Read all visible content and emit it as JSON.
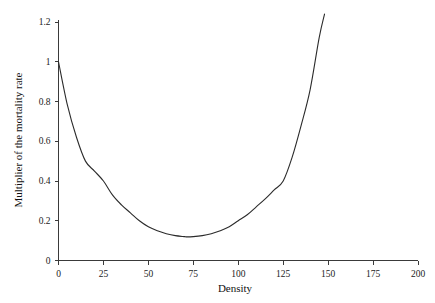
{
  "figure": {
    "background_color": "#ffffff",
    "axis_color": "#3a3a3a",
    "curve_color": "#2b2b2b"
  },
  "chart_data": {
    "type": "line",
    "title": "",
    "subtitle": "",
    "xlabel": "Density",
    "ylabel": "Multiplier of the mortality rate",
    "xlim": [
      0,
      200
    ],
    "ylim": [
      0,
      1.25
    ],
    "grid": false,
    "legend": null,
    "legend_position": "none",
    "xticks": [
      0,
      25,
      50,
      75,
      100,
      125,
      150,
      175,
      200
    ],
    "xtick_labels": [
      "0",
      "25",
      "50",
      "75",
      "100",
      "125",
      "150",
      "175",
      "200"
    ],
    "yticks": [
      0,
      0.2,
      0.4,
      0.6,
      0.8,
      1,
      1.2
    ],
    "ytick_labels": [
      "0",
      "0.2",
      "0.4",
      "0.6",
      "0.8",
      "1",
      "1.2"
    ],
    "series": [
      {
        "name": "Mortality multiplier",
        "x": [
          0,
          5,
          10,
          15,
          20,
          25,
          30,
          35,
          40,
          45,
          50,
          55,
          60,
          65,
          70,
          71,
          75,
          80,
          85,
          90,
          95,
          100,
          105,
          110,
          115,
          120,
          125,
          130,
          135,
          140,
          145,
          148
        ],
        "y": [
          1.0,
          0.78,
          0.62,
          0.5,
          0.45,
          0.4,
          0.33,
          0.28,
          0.24,
          0.2,
          0.17,
          0.15,
          0.135,
          0.125,
          0.12,
          0.119,
          0.12,
          0.125,
          0.135,
          0.15,
          0.17,
          0.2,
          0.23,
          0.27,
          0.31,
          0.355,
          0.4,
          0.52,
          0.68,
          0.86,
          1.12,
          1.24
        ]
      }
    ],
    "annotations": []
  },
  "axis_titles": {
    "x": "Density",
    "y": "Multiplier of the mortality rate"
  }
}
